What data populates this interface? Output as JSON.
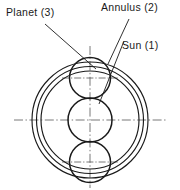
{
  "figure": {
    "type": "engineering-line-drawing",
    "background_color": "#ffffff",
    "line_color": "#1a1a1a",
    "centerline_color": "#555555"
  },
  "labels": {
    "planet": "Planet (3)",
    "annulus": "Annulus (2)",
    "sun": "Sun (1)"
  },
  "geometry": {
    "center": {
      "x": 90,
      "y": 120
    },
    "annulus_circles": [
      {
        "name": "annulus-outer",
        "r": 58
      },
      {
        "name": "annulus-middle",
        "r": 53.5
      },
      {
        "name": "annulus-inner",
        "r": 49
      }
    ],
    "sun_gear": {
      "cx": 90,
      "cy": 120,
      "r": 22
    },
    "planet_gears": [
      {
        "name": "planet-upper",
        "cx": 90,
        "cy": 78,
        "r": 20.5
      },
      {
        "name": "planet-lower",
        "cx": 90,
        "cy": 162,
        "r": 20.5
      }
    ],
    "centerlines": {
      "horizontal": {
        "x1": 14,
        "y1": 120,
        "x2": 166,
        "y2": 120
      },
      "vertical": {
        "x1": 90,
        "y1": 46,
        "x2": 90,
        "y2": 188
      }
    },
    "local_crosshairs": [
      {
        "cx": 90,
        "cy": 78,
        "half": 28
      },
      {
        "cx": 90,
        "cy": 162,
        "half": 28
      }
    ],
    "leaders": [
      {
        "name": "planet-leader",
        "x1": 45,
        "y1": 24,
        "x2": 96,
        "y2": 69
      },
      {
        "name": "annulus-leader",
        "x1": 129,
        "y1": 19,
        "x2": 108,
        "y2": 64
      },
      {
        "name": "sun-leader",
        "x1": 124,
        "y1": 41,
        "x2": 99,
        "y2": 104
      }
    ],
    "label_positions": {
      "planet": {
        "x": 6,
        "y": 16
      },
      "annulus": {
        "x": 101,
        "y": 11
      },
      "sun": {
        "x": 122,
        "y": 49
      }
    }
  }
}
